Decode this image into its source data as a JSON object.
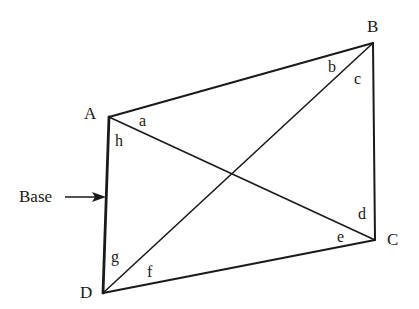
{
  "diagram": {
    "type": "quadrilateral-with-diagonals",
    "vertices": [
      {
        "id": "A",
        "label": "A",
        "x": 109,
        "y": 117
      },
      {
        "id": "B",
        "label": "B",
        "x": 373,
        "y": 43
      },
      {
        "id": "C",
        "label": "C",
        "x": 375,
        "y": 240
      },
      {
        "id": "D",
        "label": "D",
        "x": 103,
        "y": 293
      }
    ],
    "sides": [
      "AB",
      "BC",
      "CD",
      "DA"
    ],
    "diagonals": [
      "AC",
      "BD"
    ],
    "angles": [
      {
        "label": "a",
        "vertex": "A",
        "between": "AB-AC"
      },
      {
        "label": "h",
        "vertex": "A",
        "between": "AC-AD"
      },
      {
        "label": "b",
        "vertex": "B",
        "between": "BA-BD"
      },
      {
        "label": "c",
        "vertex": "B",
        "between": "BD-BC"
      },
      {
        "label": "d",
        "vertex": "C",
        "between": "CB-CA"
      },
      {
        "label": "e",
        "vertex": "C",
        "between": "CA-CD"
      },
      {
        "label": "f",
        "vertex": "D",
        "between": "DC-DB"
      },
      {
        "label": "g",
        "vertex": "D",
        "between": "DB-DA"
      }
    ],
    "annotation": {
      "label": "Base",
      "points_to": "DA"
    },
    "colors": {
      "line": "#1a1a1a",
      "background": "#ffffff"
    }
  }
}
